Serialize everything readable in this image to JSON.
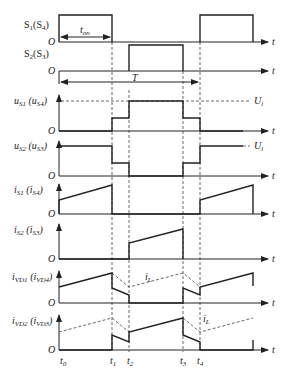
{
  "caption_fragment": "",
  "diagram": {
    "type": "timing-waveform",
    "time_markers": [
      "t0",
      "t1",
      "t2",
      "t3",
      "t4"
    ],
    "axis_label": "t",
    "origin_label": "O",
    "period_label": "T",
    "on_time_label": "t_on",
    "level_label": "U_i",
    "inductor_current_label": "i_L",
    "traces": [
      {
        "id": "s1",
        "label_main": "S",
        "label_sub": "1",
        "label_paren_main": "S",
        "label_paren_sub": "4"
      },
      {
        "id": "s2",
        "label_main": "S",
        "label_sub": "2",
        "label_paren_main": "S",
        "label_paren_sub": "3"
      },
      {
        "id": "us1",
        "label_main": "u",
        "label_sub": "S1",
        "label_paren_main": "u",
        "label_paren_sub": "S4"
      },
      {
        "id": "us2",
        "label_main": "u",
        "label_sub": "S2",
        "label_paren_main": "u",
        "label_paren_sub": "S3"
      },
      {
        "id": "is1",
        "label_main": "i",
        "label_sub": "S1",
        "label_paren_main": "i",
        "label_paren_sub": "S4"
      },
      {
        "id": "is2",
        "label_main": "i",
        "label_sub": "S2",
        "label_paren_main": "i",
        "label_paren_sub": "S3"
      },
      {
        "id": "ivd1",
        "label_main": "i",
        "label_sub": "VD1",
        "label_paren_main": "i",
        "label_paren_sub": "VD4"
      },
      {
        "id": "ivd2",
        "label_main": "i",
        "label_sub": "VD2",
        "label_paren_main": "i",
        "label_paren_sub": "VD3"
      }
    ]
  }
}
